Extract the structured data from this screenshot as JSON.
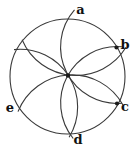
{
  "figure": {
    "background": "#ffffff",
    "stroke_color": "#3a3a3a",
    "stroke_width": 1.1,
    "label_color": "#111111",
    "label_font_size": 13,
    "canvas": {
      "width": 137,
      "height": 149
    },
    "circle": {
      "cx": 67.5,
      "cy": 76.5,
      "r": 57.5
    },
    "center_dot": {
      "name": "center-dot",
      "x": 68,
      "y": 75.5,
      "r": 2.2
    },
    "dots": [
      {
        "name": "point-b-dot",
        "x": 116.5,
        "y": 47.5,
        "r": 2.1
      },
      {
        "name": "point-c-dot",
        "x": 117,
        "y": 103.5,
        "r": 2.1
      }
    ],
    "arcs": [
      {
        "name": "arc-centered-a",
        "r": 58.5,
        "x1": 22.1,
        "y1": 39.7,
        "x2": 126.0,
        "y2": 47.3,
        "large": 0,
        "sweep": 0
      },
      {
        "name": "arc-centered-b",
        "r": 56.4,
        "x1": 74.5,
        "y1": 9.9,
        "x2": 121.9,
        "y2": 103.2,
        "large": 0,
        "sweep": 0
      },
      {
        "name": "arc-centered-c",
        "r": 56.4,
        "x1": 121.9,
        "y1": 46.8,
        "x2": 73.2,
        "y2": 138.5,
        "large": 0,
        "sweep": 0
      },
      {
        "name": "arc-centered-d",
        "r": 58.1,
        "x1": 123.0,
        "y1": 105.1,
        "x2": 18.0,
        "y2": 111.6,
        "large": 0,
        "sweep": 0
      },
      {
        "name": "arc-centered-e",
        "r": 57.7,
        "x1": 69.1,
        "y1": 137.2,
        "x2": 14.0,
        "y2": 49.6,
        "large": 0,
        "sweep": 0
      }
    ],
    "labels": [
      {
        "name": "label-a",
        "text": "a",
        "x": 80.5,
        "y": 14
      },
      {
        "name": "label-b",
        "text": "b",
        "x": 125,
        "y": 48.5
      },
      {
        "name": "label-c",
        "text": "c",
        "x": 125,
        "y": 110.5
      },
      {
        "name": "label-d",
        "text": "d",
        "x": 78,
        "y": 143.5
      },
      {
        "name": "label-e",
        "text": "e",
        "x": 10,
        "y": 111.5
      }
    ]
  }
}
